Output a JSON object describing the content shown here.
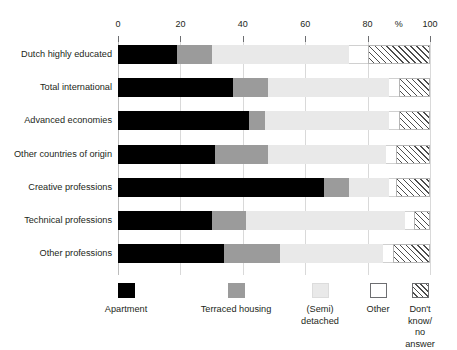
{
  "chart_data": {
    "type": "bar",
    "orientation": "horizontal",
    "stacked": true,
    "stacked_normalized": true,
    "title": "",
    "subtitle": "",
    "xlabel": "%",
    "ylabel": "",
    "xlim": [
      0,
      100
    ],
    "xticks": [
      0,
      20,
      40,
      60,
      80,
      100
    ],
    "xtick_labels": [
      "0",
      "20",
      "40",
      "60",
      "80",
      "100"
    ],
    "percent_symbol": "%",
    "percent_symbol_at": 90,
    "grid": true,
    "grid_axis": "x",
    "legend_position": "bottom",
    "categories": [
      "Dutch highly educated",
      "Total international",
      "Advanced economies",
      "Other countries of origin",
      "Creative professions",
      "Technical professions",
      "Other professions"
    ],
    "series": [
      {
        "name": "Apartment",
        "color": "#000000",
        "values": [
          19,
          37,
          42,
          31,
          66,
          30,
          34
        ]
      },
      {
        "name": "Terraced housing",
        "color": "#9b9b9b",
        "values": [
          11,
          11,
          5,
          17,
          8,
          11,
          18
        ]
      },
      {
        "name": "(Semi) detached",
        "color": "#e9e9e9",
        "values": [
          44,
          39,
          40,
          38,
          13,
          51,
          33
        ]
      },
      {
        "name": "Other",
        "color": "#ffffff",
        "values": [
          6,
          3,
          3,
          3,
          2,
          3,
          3
        ]
      },
      {
        "name": "Don't know/ no answer",
        "color": "hatched",
        "values": [
          20,
          10,
          10,
          11,
          11,
          5,
          12
        ]
      }
    ]
  },
  "axis": {
    "ticks": [
      {
        "label": "0",
        "value": 0
      },
      {
        "label": "20",
        "value": 20
      },
      {
        "label": "40",
        "value": 40
      },
      {
        "label": "60",
        "value": 60
      },
      {
        "label": "80",
        "value": 80
      },
      {
        "label": "100",
        "value": 100
      }
    ],
    "unit_label": "%"
  },
  "legend": {
    "items": [
      {
        "label": "Apartment",
        "swatch": "apartment"
      },
      {
        "label": "Terraced housing",
        "swatch": "terraced"
      },
      {
        "label": "(Semi)\ndetached",
        "swatch": "semidetached"
      },
      {
        "label": "Other",
        "swatch": "other"
      },
      {
        "label": "Don't know/\nno answer",
        "swatch": "dontknow"
      }
    ]
  }
}
